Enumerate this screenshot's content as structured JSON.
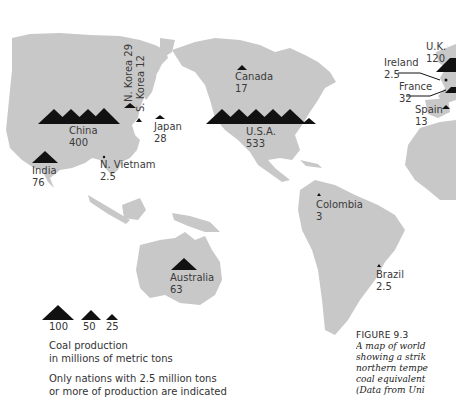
{
  "map": {
    "title": "World coal production map",
    "land_color": "#c8c8c8",
    "marker_color": "#111111",
    "countries": [
      {
        "name": "China",
        "value": "400"
      },
      {
        "name": "N. Korea",
        "value": "29"
      },
      {
        "name": "S. Korea",
        "value": "12"
      },
      {
        "name": "Japan",
        "value": "28"
      },
      {
        "name": "India",
        "value": "76"
      },
      {
        "name": "N. Vietnam",
        "value": "2.5"
      },
      {
        "name": "Canada",
        "value": "17"
      },
      {
        "name": "U.S.A.",
        "value": "533"
      },
      {
        "name": "U.K.",
        "value": "120"
      },
      {
        "name": "Ireland",
        "value": "2.5"
      },
      {
        "name": "France",
        "value": "32"
      },
      {
        "name": "Spain",
        "value": "13"
      },
      {
        "name": "Colombia",
        "value": "3"
      },
      {
        "name": "Brazil",
        "value": "2.5"
      },
      {
        "name": "Australia",
        "value": "63"
      }
    ]
  },
  "legend": {
    "scale": [
      "100",
      "50",
      "25"
    ],
    "line1": "Coal production",
    "line2": "in millions of metric tons",
    "line3": "Only nations with 2.5 million tons",
    "line4": "or more of production are indicated"
  },
  "caption": {
    "figure": "FIGURE 9.3",
    "lines": [
      "A map of world",
      "showing a strik",
      "northern tempe",
      "coal equivalent",
      "(Data from Uni"
    ]
  }
}
